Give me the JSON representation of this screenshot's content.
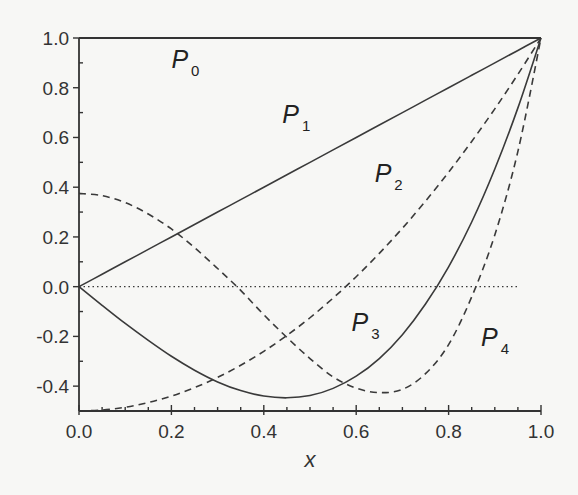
{
  "chart_data": {
    "type": "line",
    "title": "",
    "xlabel": "x",
    "ylabel": "",
    "xlim": [
      0.0,
      1.0
    ],
    "ylim": [
      -0.5,
      1.0
    ],
    "grid": false,
    "legend": "inline curve labels",
    "x_ticks": [
      "0.0",
      "0.2",
      "0.4",
      "0.6",
      "0.8",
      "1.0"
    ],
    "y_ticks": [
      "-0.4",
      "-0.2",
      "0.0",
      "0.2",
      "0.4",
      "0.6",
      "0.8",
      "1.0"
    ],
    "reference_line": {
      "y": 0.0,
      "style": "dotted",
      "x_range": [
        0.0,
        0.95
      ]
    },
    "x": [
      0.0,
      0.05,
      0.1,
      0.15,
      0.2,
      0.25,
      0.3,
      0.35,
      0.4,
      0.45,
      0.5,
      0.55,
      0.6,
      0.65,
      0.7,
      0.75,
      0.8,
      0.85,
      0.9,
      0.95,
      1.0
    ],
    "series": [
      {
        "name": "P0",
        "label": "P",
        "sub": "0",
        "style": "solid",
        "label_pos": [
          0.2,
          0.88
        ],
        "values": [
          1,
          1,
          1,
          1,
          1,
          1,
          1,
          1,
          1,
          1,
          1,
          1,
          1,
          1,
          1,
          1,
          1,
          1,
          1,
          1,
          1
        ]
      },
      {
        "name": "P1",
        "label": "P",
        "sub": "1",
        "style": "solid",
        "label_pos": [
          0.44,
          0.66
        ],
        "values": [
          0.0,
          0.05,
          0.1,
          0.15,
          0.2,
          0.25,
          0.3,
          0.35,
          0.4,
          0.45,
          0.5,
          0.55,
          0.6,
          0.65,
          0.7,
          0.75,
          0.8,
          0.85,
          0.9,
          0.95,
          1.0
        ]
      },
      {
        "name": "P2",
        "label": "P",
        "sub": "2",
        "style": "dashed",
        "label_pos": [
          0.64,
          0.42
        ],
        "values": [
          -0.5,
          -0.496,
          -0.485,
          -0.466,
          -0.44,
          -0.406,
          -0.365,
          -0.316,
          -0.26,
          -0.196,
          -0.125,
          -0.046,
          0.04,
          0.134,
          0.235,
          0.344,
          0.46,
          0.584,
          0.715,
          0.854,
          1.0
        ]
      },
      {
        "name": "P3",
        "label": "P",
        "sub": "3",
        "style": "solid",
        "label_pos": [
          0.59,
          -0.18
        ],
        "values": [
          0.0,
          -0.075,
          -0.148,
          -0.216,
          -0.28,
          -0.336,
          -0.383,
          -0.418,
          -0.44,
          -0.447,
          -0.438,
          -0.409,
          -0.36,
          -0.289,
          -0.193,
          -0.07,
          0.08,
          0.26,
          0.473,
          0.719,
          1.0
        ]
      },
      {
        "name": "P4",
        "label": "P",
        "sub": "4",
        "style": "dashed",
        "label_pos": [
          0.87,
          -0.24
        ],
        "values": [
          0.375,
          0.366,
          0.338,
          0.292,
          0.232,
          0.157,
          0.073,
          -0.015,
          -0.113,
          -0.204,
          -0.289,
          -0.363,
          -0.408,
          -0.426,
          -0.413,
          -0.35,
          -0.233,
          -0.041,
          0.208,
          0.544,
          1.0
        ]
      }
    ]
  },
  "axes": {
    "xlabel": "x",
    "x_tick_labels": [
      "0.0",
      "0.2",
      "0.4",
      "0.6",
      "0.8",
      "1.0"
    ],
    "y_tick_labels": [
      "-0.4",
      "-0.2",
      "0.0",
      "0.2",
      "0.4",
      "0.6",
      "0.8",
      "1.0"
    ]
  },
  "colors": {
    "line": "#3a3a3a",
    "axis": "#333333",
    "background": "#f7f7f5"
  }
}
